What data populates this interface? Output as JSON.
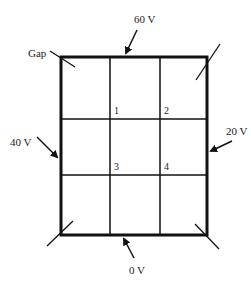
{
  "diagram": {
    "gap_label": "Gap",
    "potentials": {
      "top": "60 V",
      "left": "40 V",
      "right": "20 V",
      "bottom": "0 V"
    },
    "nodes": [
      "1",
      "2",
      "3",
      "4"
    ],
    "grid": {
      "rows": 3,
      "cols": 3
    },
    "colors": {
      "line": "#111111",
      "text": "#222222",
      "background": "#ffffff"
    }
  }
}
